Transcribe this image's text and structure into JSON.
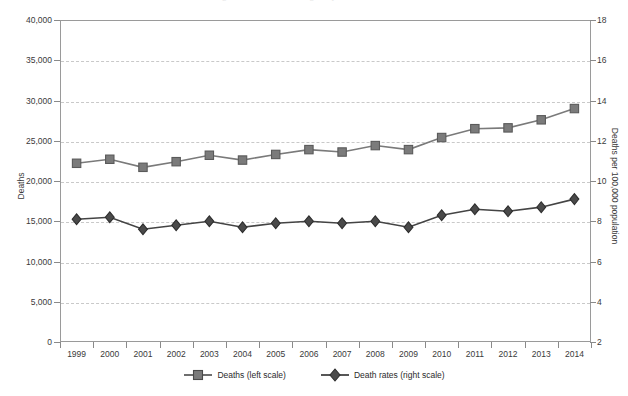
{
  "title_sliver": "Figure 1. Number and age-adjusted rate of deaths",
  "axes": {
    "left": {
      "label": "Deaths",
      "ticks": [
        "0",
        "5,000",
        "10,000",
        "15,000",
        "20,000",
        "25,000",
        "30,000",
        "35,000",
        "40,000"
      ],
      "min": 0,
      "max": 40000,
      "step": 5000
    },
    "right": {
      "label": "Deaths per 100,000 population",
      "ticks": [
        "2",
        "4",
        "6",
        "8",
        "10",
        "12",
        "14",
        "16",
        "18"
      ],
      "min": 2,
      "max": 18,
      "step": 2
    },
    "x": {
      "label": "",
      "ticks": [
        "1999",
        "2000",
        "2001",
        "2002",
        "2003",
        "2004",
        "2005",
        "2006",
        "2007",
        "2008",
        "2009",
        "2010",
        "2011",
        "2012",
        "2013",
        "2014"
      ]
    }
  },
  "legend": {
    "position": "bottom-center",
    "items": [
      {
        "label": "Deaths (left scale)",
        "marker": "square-marker",
        "color": "#7b7b7b",
        "edge": "#4a4a4a"
      },
      {
        "label": "Death rates (right scale)",
        "marker": "diamond-marker",
        "color": "#4a4a4a",
        "edge": "#2e2e2e"
      }
    ]
  },
  "colors": {
    "deaths_series": "#7b7b7b",
    "deaths_line": "#7a7a7a",
    "rates_series": "#4a4a4a",
    "rates_line": "#444444",
    "grid": "#c9c9c9",
    "frame": "#9a9a9a",
    "text": "#3a3a3a"
  },
  "chart_data": {
    "type": "line",
    "title": "",
    "xlabel": "",
    "ylabel": "Deaths",
    "y2label": "Deaths per 100,000 population",
    "grid": true,
    "legend_position": "bottom-center",
    "ylim": [
      0,
      40000
    ],
    "y2lim": [
      2,
      18
    ],
    "categories": [
      "1999",
      "2000",
      "2001",
      "2002",
      "2003",
      "2004",
      "2005",
      "2006",
      "2007",
      "2008",
      "2009",
      "2010",
      "2011",
      "2012",
      "2013",
      "2014"
    ],
    "series": [
      {
        "name": "Deaths (left scale)",
        "axis": "left",
        "marker": "square",
        "values": [
          22200,
          22700,
          21700,
          22400,
          23200,
          22600,
          23300,
          23900,
          23600,
          24400,
          23900,
          25400,
          26500,
          26600,
          27600,
          29000
        ]
      },
      {
        "name": "Death rates (right scale)",
        "axis": "right",
        "marker": "diamond",
        "values": [
          8.1,
          8.2,
          7.6,
          7.8,
          8.0,
          7.7,
          7.9,
          8.0,
          7.9,
          8.0,
          7.7,
          8.3,
          8.6,
          8.5,
          8.7,
          9.1
        ]
      }
    ]
  }
}
